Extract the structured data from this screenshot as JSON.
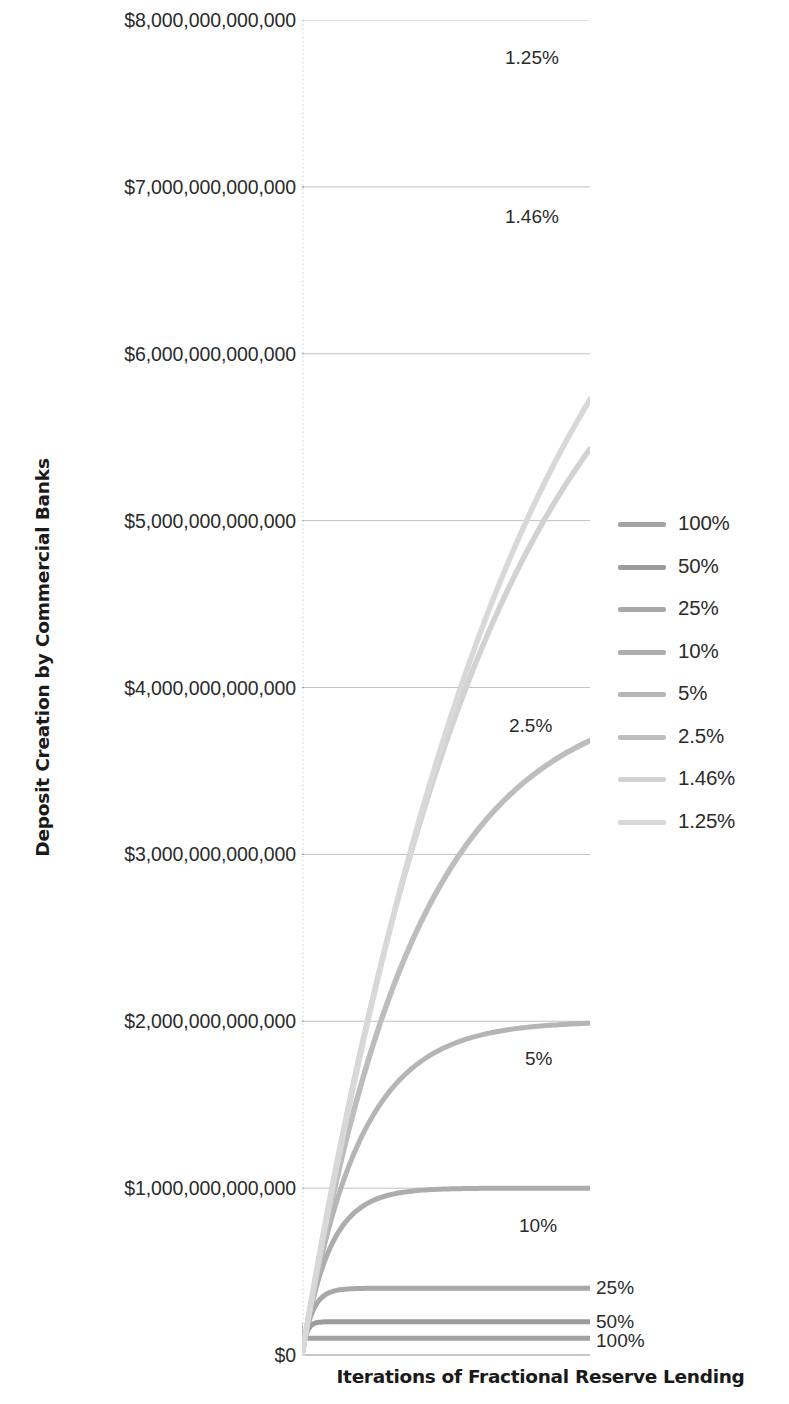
{
  "chart_data": {
    "type": "line",
    "title": "",
    "xlabel": "Iterations of Fractional Reserve Lending",
    "ylabel": "Deposit Creation by Commercial Banks",
    "ylim": [
      0,
      8000000000000
    ],
    "xlim": [
      0,
      100
    ],
    "grid": true,
    "legend_position": "right",
    "y_tick_labels": [
      "$8,000,000,000,000",
      "$7,000,000,000,000",
      "$6,000,000,000,000",
      "$5,000,000,000,000",
      "$4,000,000,000,000",
      "$3,000,000,000,000",
      "$2,000,000,000,000",
      "$1,000,000,000,000",
      "$0"
    ],
    "y_tick_values": [
      8000000000000,
      7000000000000,
      6000000000000,
      5000000000000,
      4000000000000,
      3000000000000,
      2000000000000,
      1000000000000,
      0
    ],
    "series": [
      {
        "name": "100%",
        "reserve_ratio_pct": 100,
        "plateau": 100000000000,
        "color": "#a3a3a3",
        "label_in_plot": "100%"
      },
      {
        "name": "50%",
        "reserve_ratio_pct": 50,
        "plateau": 200000000000,
        "color": "#9b9b9b",
        "label_in_plot": "50%"
      },
      {
        "name": "25%",
        "reserve_ratio_pct": 25,
        "plateau": 400000000000,
        "color": "#a8a8a8",
        "label_in_plot": "25%"
      },
      {
        "name": "10%",
        "reserve_ratio_pct": 10,
        "plateau": 1000000000000,
        "color": "#adadad",
        "label_in_plot": "10%"
      },
      {
        "name": "5%",
        "reserve_ratio_pct": 5,
        "plateau": 2000000000000,
        "color": "#b5b5b5",
        "label_in_plot": "5%"
      },
      {
        "name": "2.5%",
        "reserve_ratio_pct": 2.5,
        "plateau": 4000000000000,
        "color": "#bdbdbd",
        "label_in_plot": "2.5%"
      },
      {
        "name": "1.46%",
        "reserve_ratio_pct": 1.46,
        "plateau": 7050000000000,
        "color": "#d2d2d2",
        "label_in_plot": "1.46%"
      },
      {
        "name": "1.25%",
        "reserve_ratio_pct": 1.25,
        "plateau": 8000000000000,
        "color": "#d8d8d8",
        "label_in_plot": "1.25%"
      }
    ]
  },
  "legend": {
    "items": [
      {
        "label": "100%"
      },
      {
        "label": "50%"
      },
      {
        "label": "25%"
      },
      {
        "label": "10%"
      },
      {
        "label": "5%"
      },
      {
        "label": "2.5%"
      },
      {
        "label": "1.46%"
      },
      {
        "label": "1.25%"
      }
    ]
  },
  "axes": {
    "y_title": "Deposit Creation by Commercial Banks",
    "x_title": "Iterations of Fractional Reserve Lending"
  }
}
